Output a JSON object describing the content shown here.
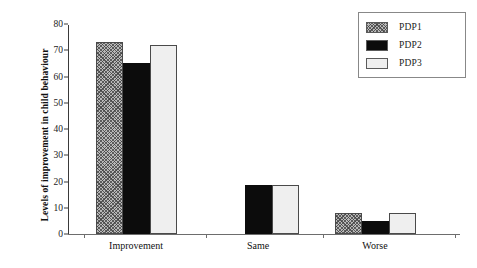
{
  "chart_data": {
    "type": "bar",
    "title": "",
    "xlabel": "",
    "ylabel": "Levels of improvement in child behaviour",
    "categories": [
      "Improvement",
      "Same",
      "Worse"
    ],
    "ylim": [
      0,
      80
    ],
    "yticks": [
      0,
      10,
      20,
      30,
      40,
      50,
      60,
      70,
      80
    ],
    "ytick_labels": [
      "0",
      "10",
      "20",
      "30",
      "40",
      "50",
      "60",
      "70",
      "80"
    ],
    "grid": false,
    "legend_position": "top-right",
    "series": [
      {
        "name": "PDP1",
        "values": [
          73,
          0,
          8
        ],
        "color": "#b9b9b9",
        "pattern": "cross-hatch"
      },
      {
        "name": "PDP2",
        "values": [
          65,
          18.5,
          5
        ],
        "color": "#0c0c0c",
        "pattern": "solid"
      },
      {
        "name": "PDP3",
        "values": [
          72,
          18.5,
          8
        ],
        "color": "#efefef",
        "pattern": "light"
      }
    ]
  },
  "legend": {
    "entries": [
      {
        "label": "PDP1"
      },
      {
        "label": "PDP2"
      },
      {
        "label": "PDP3"
      }
    ]
  }
}
